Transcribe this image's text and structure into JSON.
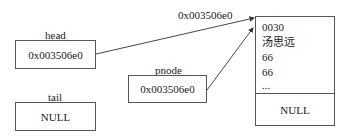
{
  "pointers": {
    "head": {
      "label": "head",
      "value": "0x003506e0"
    },
    "tail": {
      "label": "tail",
      "value": "NULL"
    },
    "pnode": {
      "label": "pnode",
      "value": "0x003506e0"
    }
  },
  "arrow_label": "0x003506e0",
  "node": {
    "fields": [
      "0030",
      "汤思远",
      "66",
      "66",
      "..."
    ],
    "next": "NULL"
  }
}
